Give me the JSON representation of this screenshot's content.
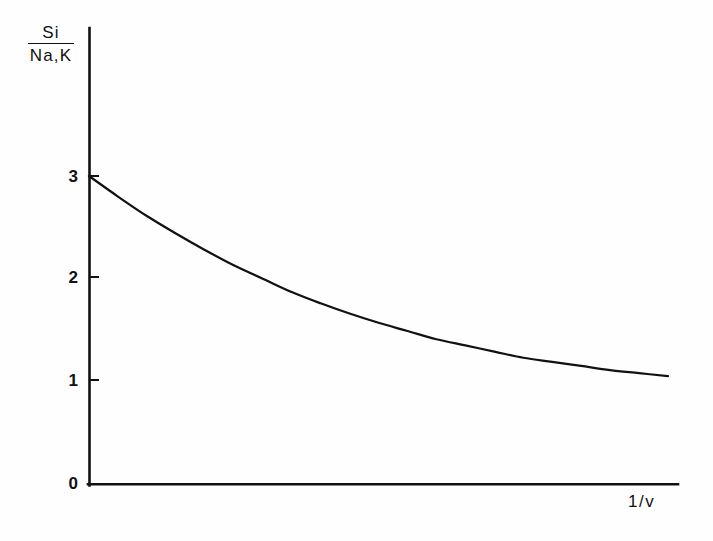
{
  "figure": {
    "background_color": "#fefefe",
    "ink_color": "#111111"
  },
  "chart_data": {
    "type": "line",
    "title": "",
    "subtitle": "",
    "ylabel_numerator": "Si",
    "ylabel_denominator": "Na,K",
    "ylabel": "Si / Na,K",
    "xlabel": "1/v",
    "grid": false,
    "legend": null,
    "annotations": [],
    "xlim": [
      0,
      1
    ],
    "ylim": [
      0,
      3.45
    ],
    "xtick_labels": [],
    "ytick_labels": [
      "0",
      "1",
      "2",
      "3"
    ],
    "ytick_values": [
      0,
      1,
      2,
      3
    ],
    "series": [
      {
        "name": "Si/(Na,K) ratio",
        "color": "#111111",
        "x": [
          0.0,
          0.05,
          0.1,
          0.15,
          0.2,
          0.25,
          0.3,
          0.35,
          0.4,
          0.45,
          0.5,
          0.55,
          0.6,
          0.65,
          0.7,
          0.75,
          0.8,
          0.85,
          0.9,
          0.95,
          1.0
        ],
        "y": [
          3.0,
          2.8,
          2.61,
          2.44,
          2.28,
          2.13,
          2.0,
          1.87,
          1.76,
          1.66,
          1.57,
          1.49,
          1.41,
          1.35,
          1.29,
          1.23,
          1.19,
          1.15,
          1.11,
          1.08,
          1.05
        ]
      }
    ]
  },
  "axes": {
    "y_axis_label_top": "Si",
    "y_axis_label_bottom": "Na,K",
    "x_axis_label": "1/v",
    "tick_0": "0",
    "tick_1": "1",
    "tick_2": "2",
    "tick_3": "3"
  }
}
